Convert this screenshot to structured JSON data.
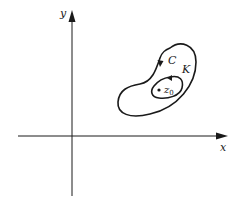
{
  "diagram": {
    "axes": {
      "x_label": "x",
      "y_label": "y"
    },
    "contours": [
      {
        "name": "C",
        "label": "C",
        "description": "outer closed curve, clockwise arrow"
      },
      {
        "name": "K",
        "label": "K",
        "description": "inner closed curve around z0, arrow"
      }
    ],
    "point": {
      "label_base": "z",
      "label_sub": "0"
    },
    "colors": {
      "stroke": "#1a1a1a",
      "background": "#ffffff"
    }
  }
}
